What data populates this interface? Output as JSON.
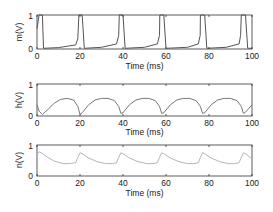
{
  "chart_data": [
    {
      "type": "line",
      "title": "",
      "xlabel": "Time (ms)",
      "ylabel": "m(V)",
      "xlim": [
        0,
        100
      ],
      "ylim": [
        0,
        1
      ],
      "xticks": [
        0,
        20,
        40,
        60,
        80,
        100
      ],
      "yticks": [
        0,
        1
      ],
      "grid": false,
      "line_color": "#555555",
      "spike_times_ms": [
        1,
        19.5,
        38.3,
        57.1,
        75.9,
        94.7
      ],
      "description": "Gating variable m: sharp pulses to ~1 at each spike, near 0 with slow ramp up to ~0.15 between spikes",
      "series": [
        {
          "name": "m",
          "x": [
            0,
            1,
            2.5,
            3,
            10,
            18,
            19,
            19.5,
            21,
            22,
            30,
            37,
            38,
            38.3,
            40,
            41,
            50,
            56,
            57,
            57.1,
            59,
            60,
            70,
            75,
            75.9,
            76,
            78,
            79,
            88,
            94,
            94.7,
            95,
            97,
            98,
            100
          ],
          "values": [
            0.6,
            1,
            1,
            0.02,
            0.04,
            0.12,
            0.3,
            1,
            1,
            0.02,
            0.05,
            0.15,
            0.4,
            1,
            1,
            0.02,
            0.05,
            0.15,
            0.4,
            1,
            1,
            0.02,
            0.05,
            0.15,
            0.4,
            1,
            1,
            0.02,
            0.05,
            0.15,
            0.4,
            1,
            1,
            0.02,
            0.02
          ]
        }
      ]
    },
    {
      "type": "line",
      "title": "",
      "xlabel": "Time (ms)",
      "ylabel": "h(V)",
      "xlim": [
        0,
        100
      ],
      "ylim": [
        0,
        1
      ],
      "xticks": [
        0,
        20,
        40,
        60,
        80,
        100
      ],
      "yticks": [
        0,
        1
      ],
      "grid": false,
      "line_color": "#777777",
      "description": "Gating variable h: dips to ~0.05 after each spike, recovers in a dome to ~0.55",
      "series": [
        {
          "name": "h",
          "x": [
            0,
            1,
            2.5,
            5,
            8,
            11,
            14,
            17,
            19,
            20,
            21,
            24,
            27,
            30,
            33,
            36,
            38,
            39,
            40,
            43,
            46,
            49,
            52,
            55,
            57,
            58,
            59,
            62,
            65,
            68,
            71,
            74,
            76,
            77,
            78,
            81,
            84,
            87,
            90,
            93,
            95,
            96,
            97,
            100
          ],
          "values": [
            0.35,
            0.15,
            0.05,
            0.2,
            0.4,
            0.52,
            0.55,
            0.5,
            0.3,
            0.05,
            0.1,
            0.35,
            0.5,
            0.55,
            0.55,
            0.48,
            0.3,
            0.08,
            0.1,
            0.35,
            0.5,
            0.55,
            0.55,
            0.48,
            0.3,
            0.08,
            0.1,
            0.35,
            0.5,
            0.55,
            0.55,
            0.48,
            0.3,
            0.08,
            0.1,
            0.35,
            0.5,
            0.55,
            0.55,
            0.48,
            0.3,
            0.08,
            0.12,
            0.35
          ]
        }
      ]
    },
    {
      "type": "line",
      "title": "",
      "xlabel": "Time (ms)",
      "ylabel": "n(V)",
      "xlim": [
        0,
        100
      ],
      "ylim": [
        0,
        1
      ],
      "xticks": [
        0,
        20,
        40,
        60,
        80,
        100
      ],
      "yticks": [
        0,
        1
      ],
      "grid": false,
      "line_color": "#b5b5b5",
      "description": "Gating variable n: rises to ~0.75 at each spike, decays to ~0.4 between spikes",
      "series": [
        {
          "name": "n",
          "x": [
            0,
            1,
            2,
            5,
            8,
            12,
            15,
            18,
            19,
            20,
            21,
            24,
            28,
            32,
            35,
            37,
            38,
            39,
            40,
            43,
            47,
            51,
            54,
            56,
            57,
            58,
            59,
            62,
            66,
            70,
            73,
            75,
            76,
            77,
            78,
            81,
            85,
            89,
            92,
            94,
            95,
            96,
            97,
            100
          ],
          "values": [
            0.7,
            0.78,
            0.75,
            0.6,
            0.48,
            0.4,
            0.4,
            0.43,
            0.6,
            0.75,
            0.72,
            0.58,
            0.46,
            0.4,
            0.4,
            0.43,
            0.6,
            0.75,
            0.72,
            0.58,
            0.46,
            0.4,
            0.4,
            0.43,
            0.6,
            0.75,
            0.72,
            0.58,
            0.46,
            0.4,
            0.4,
            0.43,
            0.6,
            0.75,
            0.72,
            0.58,
            0.46,
            0.4,
            0.4,
            0.43,
            0.6,
            0.75,
            0.72,
            0.55
          ]
        }
      ]
    }
  ],
  "panels": [
    {
      "ylabel": "m(V)",
      "xlabel": "Time (ms)",
      "ytick_top": "1",
      "ytick_bottom": "0",
      "xticks": [
        "0",
        "20",
        "40",
        "60",
        "80",
        "100"
      ]
    },
    {
      "ylabel": "h(V)",
      "xlabel": "Time (ms)",
      "ytick_top": "1",
      "ytick_bottom": "0",
      "xticks": [
        "0",
        "20",
        "40",
        "60",
        "80",
        "100"
      ]
    },
    {
      "ylabel": "n(V)",
      "xlabel": "Time (ms)",
      "ytick_top": "1",
      "ytick_bottom": "0",
      "xticks": [
        "0",
        "20",
        "40",
        "60",
        "80",
        "100"
      ]
    }
  ]
}
